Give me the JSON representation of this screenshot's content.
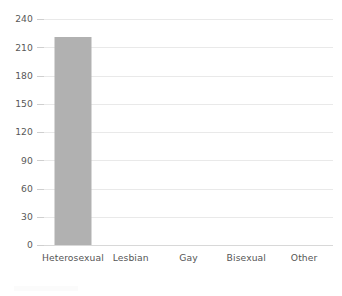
{
  "chart_data": {
    "type": "bar",
    "title": "",
    "subtitle": "",
    "xlabel": "",
    "ylabel": "",
    "categories": [
      "Heterosexual",
      "Lesbian",
      "Gay",
      "Bisexual",
      "Other"
    ],
    "values": [
      221,
      0,
      0,
      0,
      0
    ],
    "series": [
      {
        "name": "Count",
        "values": [
          221,
          0,
          0,
          0,
          0
        ]
      }
    ],
    "ylim": [
      0,
      240
    ],
    "ytick_labels": [
      "0",
      "30",
      "60",
      "90",
      "120",
      "150",
      "180",
      "210",
      "240"
    ],
    "ytick_values": [
      0,
      30,
      60,
      90,
      120,
      150,
      180,
      210,
      240
    ],
    "grid": true,
    "grid_axis": "y",
    "legend": false,
    "legend_position": "none",
    "annotations": [],
    "colors": {
      "bar": "#b1b1b1",
      "gridline": "#e9e9e9",
      "baseline": "#d8d8d8",
      "tick_mark": "#cfcfcf",
      "tick_label_text": "#585858",
      "category_label_text": "#555555",
      "background": "#ffffff"
    }
  }
}
